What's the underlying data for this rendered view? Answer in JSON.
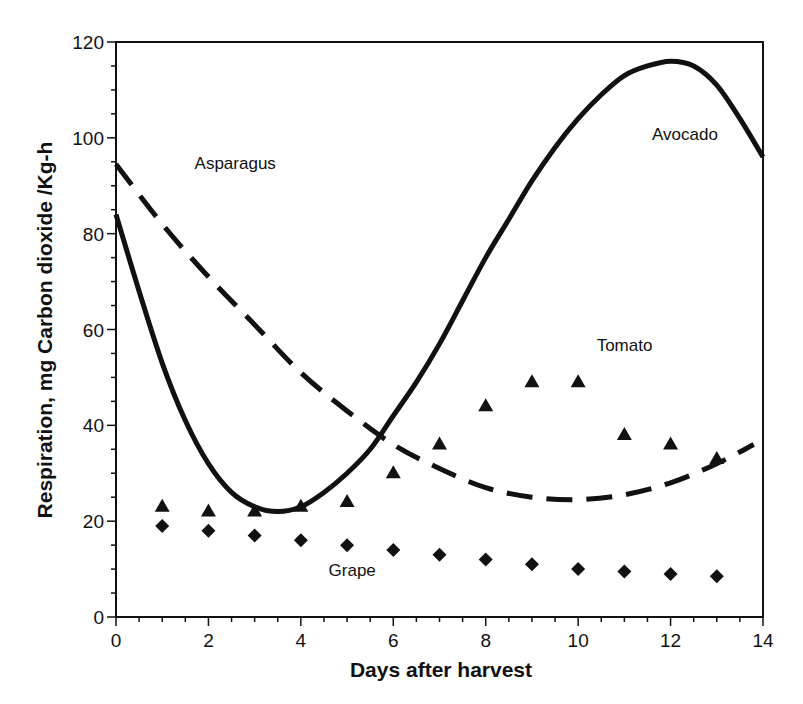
{
  "chart_data": {
    "type": "line",
    "title": "",
    "xlabel": "Days after harvest",
    "ylabel": "Respiration, mg Carbon dioxide /Kg-h",
    "xlim": [
      0,
      14
    ],
    "ylim": [
      0,
      120
    ],
    "x_ticks": [
      0,
      2,
      4,
      6,
      8,
      10,
      12,
      14
    ],
    "y_ticks": [
      0,
      20,
      40,
      60,
      80,
      100,
      120
    ],
    "x_minor_step": 0.5,
    "y_minor_step": 5,
    "grid": false,
    "legend": "inline labels",
    "series": [
      {
        "name": "Avocado",
        "style": "solid line",
        "x": [
          0,
          0.5,
          1,
          1.5,
          2,
          2.5,
          3,
          3.5,
          4,
          4.5,
          5,
          5.5,
          6,
          6.5,
          7,
          7.5,
          8,
          8.5,
          9,
          9.5,
          10,
          10.5,
          11,
          11.5,
          12,
          12.5,
          13,
          13.5,
          14
        ],
        "values": [
          84,
          68,
          53,
          41,
          32,
          26,
          23,
          22,
          23,
          26,
          30,
          35,
          42,
          49,
          57,
          66,
          75,
          83,
          91,
          98,
          104,
          109,
          113,
          115,
          116,
          115,
          111,
          104,
          96
        ]
      },
      {
        "name": "Asparagus",
        "style": "dashed line",
        "x": [
          0,
          1,
          2,
          3,
          4,
          5,
          6,
          7,
          8,
          9,
          10,
          11,
          12,
          13,
          13.8
        ],
        "values": [
          94.5,
          82,
          71,
          61,
          51,
          43,
          36,
          31,
          27,
          25,
          24.5,
          25.5,
          28,
          32,
          36
        ]
      },
      {
        "name": "Tomato",
        "style": "triangle markers",
        "x": [
          1,
          2,
          3,
          4,
          5,
          6,
          7,
          8,
          9,
          10,
          11,
          12,
          13
        ],
        "values": [
          23,
          22,
          22,
          23,
          24,
          30,
          36,
          44,
          49,
          49,
          38,
          36,
          33
        ]
      },
      {
        "name": "Grape",
        "style": "diamond markers",
        "x": [
          1,
          2,
          3,
          4,
          5,
          6,
          7,
          8,
          9,
          10,
          11,
          12,
          13
        ],
        "values": [
          19,
          18,
          17,
          16,
          15,
          14,
          13,
          12,
          11,
          10,
          9.5,
          9,
          8.5
        ]
      }
    ],
    "annotations": [
      {
        "text": "Avocado",
        "x": 11.6,
        "y": 99.5
      },
      {
        "text": "Asparagus",
        "x": 1.7,
        "y": 93.5
      },
      {
        "text": "Tomato",
        "x": 10.4,
        "y": 55.5
      },
      {
        "text": "Grape",
        "x": 4.6,
        "y": 8.5
      }
    ]
  },
  "colors": {
    "ink": "#111111",
    "background": "#ffffff"
  }
}
